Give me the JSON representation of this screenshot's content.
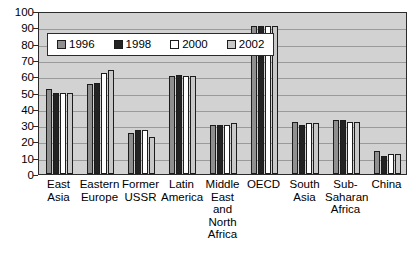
{
  "chart_data": {
    "type": "bar",
    "title": "",
    "subtitle": "",
    "xlabel": "",
    "ylabel": "",
    "ylim": [
      0,
      100
    ],
    "ytick_step": 10,
    "yticks": [
      100,
      90,
      80,
      70,
      60,
      50,
      40,
      30,
      20,
      10,
      0
    ],
    "grid": true,
    "legend_position": "top-left-inside",
    "categories": [
      "East Asia",
      "Eastern Europe",
      "Former USSR",
      "Latin America",
      "Middle East and North Africa",
      "OECD",
      "South Asia",
      "Sub-Saharan Africa",
      "China"
    ],
    "category_lines": [
      [
        "East",
        "Asia"
      ],
      [
        "Eastern",
        "Europe"
      ],
      [
        "Former",
        "USSR"
      ],
      [
        "Latin",
        "America"
      ],
      [
        "Middle",
        "East and",
        "North",
        "Africa"
      ],
      [
        "OECD"
      ],
      [
        "South",
        "Asia"
      ],
      [
        "Sub-",
        "Saharan",
        "Africa"
      ],
      [
        "China"
      ]
    ],
    "series": [
      {
        "name": "1996",
        "color": "#8f8f8f",
        "values": [
          52,
          55,
          25,
          60,
          30,
          91,
          32,
          33,
          14
        ]
      },
      {
        "name": "1998",
        "color": "#232323",
        "values": [
          50,
          56,
          27,
          61,
          30,
          91,
          30,
          33,
          11
        ]
      },
      {
        "name": "2000",
        "color": "#ffffff",
        "values": [
          50,
          62,
          27,
          60,
          30,
          91,
          31,
          32,
          12
        ]
      },
      {
        "name": "2002",
        "color": "#c8c8c8",
        "values": [
          50,
          64,
          23,
          60,
          31,
          91,
          31,
          32,
          12
        ]
      }
    ]
  },
  "legend": {
    "items": [
      {
        "label": "1996"
      },
      {
        "label": "1998"
      },
      {
        "label": "2000"
      },
      {
        "label": "2002"
      }
    ]
  },
  "colors": {
    "plot_background": "#d2d2d2",
    "gridline": "#9a9a9a",
    "axis": "#2b2b2b",
    "text": "#000000",
    "page_background": "#ffffff"
  }
}
